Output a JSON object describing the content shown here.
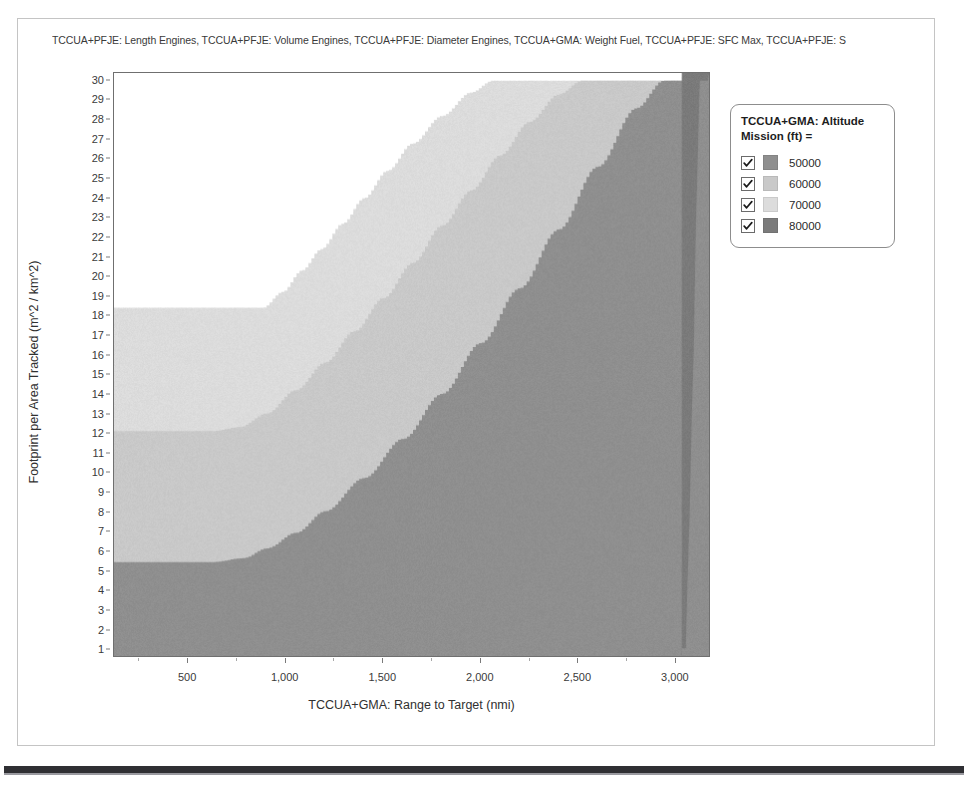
{
  "chart_title": "TCCUA+PFJE: Length Engines, TCCUA+PFJE: Volume Engines, TCCUA+PFJE: Diameter Engines, TCCUA+GMA: Weight Fuel, TCCUA+PFJE: SFC Max, TCCUA+PFJE: S",
  "legend": {
    "title": "TCCUA+GMA: Altitude\nMission (ft) =",
    "entries": [
      {
        "label": "50000",
        "color": "#8f8f8f",
        "checked": true
      },
      {
        "label": "60000",
        "color": "#c9c9c9",
        "checked": true
      },
      {
        "label": "70000",
        "color": "#dcdcdc",
        "checked": true
      },
      {
        "label": "80000",
        "color": "#7b7b7b",
        "checked": true
      }
    ]
  },
  "chart_data": {
    "type": "area",
    "title": "TCCUA+PFJE: Length Engines, TCCUA+PFJE: Volume Engines, TCCUA+PFJE: Diameter Engines, TCCUA+GMA: Weight Fuel, TCCUA+PFJE: SFC Max, TCCUA+PFJE: S",
    "xlabel": "TCCUA+GMA: Range to Target (nmi)",
    "ylabel": "Footprint per Area Tracked (m^2 / km^2)",
    "xlim": [
      120,
      3180
    ],
    "ylim": [
      0.6,
      30.4
    ],
    "grid": false,
    "legend_position": "right",
    "x_ticks": [
      500,
      1000,
      1500,
      2000,
      2500,
      3000
    ],
    "x_tick_labels": [
      "500",
      "1,000",
      "1,500",
      "2,000",
      "2,500",
      "3,000"
    ],
    "y_ticks": [
      1,
      2,
      3,
      4,
      5,
      6,
      7,
      8,
      9,
      10,
      11,
      12,
      13,
      14,
      15,
      16,
      17,
      18,
      19,
      20,
      21,
      22,
      23,
      24,
      25,
      26,
      27,
      28,
      29,
      30
    ],
    "y_tick_labels": [
      "1",
      "2",
      "3",
      "4",
      "5",
      "6",
      "7",
      "8",
      "9",
      "10",
      "11",
      "12",
      "13",
      "14",
      "15",
      "16",
      "17",
      "18",
      "19",
      "20",
      "21",
      "22",
      "23",
      "24",
      "25",
      "26",
      "27",
      "28",
      "29",
      "30"
    ],
    "background_region": "#ffffff",
    "series": [
      {
        "name": "70000",
        "color": "#dcdcdc",
        "description": "Lightest band — feasible region boundary sweeping from y=18.4 on the left, rising hyperbolically to the top-right.",
        "boundary": [
          [
            120,
            18.4
          ],
          [
            400,
            18.4
          ],
          [
            700,
            18.4
          ],
          [
            880,
            18.4
          ],
          [
            980,
            19.2
          ],
          [
            1080,
            20.3
          ],
          [
            1180,
            21.4
          ],
          [
            1290,
            22.7
          ],
          [
            1400,
            24.0
          ],
          [
            1520,
            25.4
          ],
          [
            1650,
            26.8
          ],
          [
            1800,
            28.2
          ],
          [
            1950,
            29.4
          ],
          [
            2060,
            30.0
          ],
          [
            3180,
            30.0
          ]
        ]
      },
      {
        "name": "60000",
        "color": "#c9c9c9",
        "description": "Middle band — boundary starts at y=12.1 on the left, curves up steeply toward the right edge.",
        "boundary": [
          [
            120,
            12.1
          ],
          [
            400,
            12.1
          ],
          [
            620,
            12.1
          ],
          [
            760,
            12.3
          ],
          [
            900,
            13.0
          ],
          [
            1050,
            14.2
          ],
          [
            1200,
            15.6
          ],
          [
            1350,
            17.2
          ],
          [
            1500,
            18.9
          ],
          [
            1650,
            20.7
          ],
          [
            1800,
            22.6
          ],
          [
            1950,
            24.4
          ],
          [
            2100,
            26.2
          ],
          [
            2250,
            27.9
          ],
          [
            2400,
            29.3
          ],
          [
            2520,
            30.0
          ],
          [
            3180,
            30.0
          ]
        ]
      },
      {
        "name": "50000",
        "color": "#8f8f8f",
        "description": "Darker band — boundary starts at y=5.4 on the left, rises sharply near the right edge.",
        "boundary": [
          [
            120,
            5.4
          ],
          [
            400,
            5.4
          ],
          [
            620,
            5.4
          ],
          [
            780,
            5.6
          ],
          [
            900,
            6.1
          ],
          [
            1050,
            6.9
          ],
          [
            1200,
            8.0
          ],
          [
            1400,
            9.7
          ],
          [
            1600,
            11.7
          ],
          [
            1800,
            14.0
          ],
          [
            2000,
            16.6
          ],
          [
            2200,
            19.4
          ],
          [
            2400,
            22.4
          ],
          [
            2600,
            25.6
          ],
          [
            2800,
            28.6
          ],
          [
            2940,
            30.0
          ],
          [
            3180,
            30.0
          ]
        ]
      },
      {
        "name": "80000",
        "color": "#7b7b7b",
        "description": "Darkest narrow strip hugging the right edge of the plot above the 50000 boundary.",
        "boundary": [
          [
            3060,
            1.0
          ],
          [
            3080,
            8.0
          ],
          [
            3100,
            16.0
          ],
          [
            3115,
            23.0
          ],
          [
            3125,
            27.0
          ],
          [
            3130,
            30.0
          ]
        ]
      }
    ]
  }
}
